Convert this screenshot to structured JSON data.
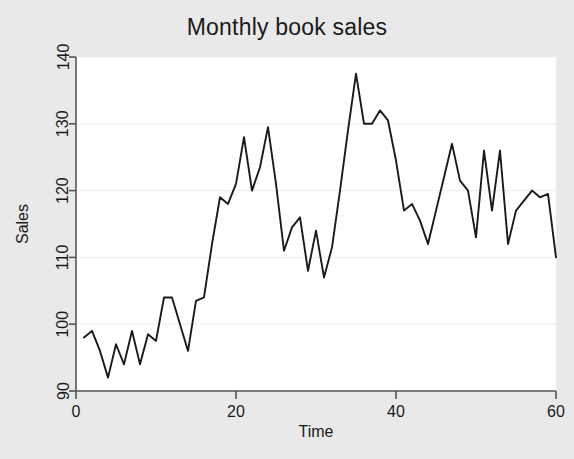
{
  "chart": {
    "title": "Monthly book sales",
    "ylabel": "Sales",
    "xlabel": "Time"
  },
  "chart_data": {
    "type": "line",
    "title": "Monthly book sales",
    "xlabel": "Time",
    "ylabel": "Sales",
    "xlim": [
      0,
      60
    ],
    "ylim": [
      90,
      140
    ],
    "xticks": [
      0,
      20,
      40,
      60
    ],
    "yticks": [
      90,
      100,
      110,
      120,
      130,
      140
    ],
    "grid": "horizontal",
    "legend": "none",
    "line_color": "#1a1a1a",
    "background_color": "#e9e9e9",
    "plot_background_color": "#ffffff",
    "series": [
      {
        "name": "Sales",
        "x": [
          1,
          2,
          3,
          4,
          5,
          6,
          7,
          8,
          9,
          10,
          11,
          12,
          13,
          14,
          15,
          16,
          17,
          18,
          19,
          20,
          21,
          22,
          23,
          24,
          25,
          26,
          27,
          28,
          29,
          30,
          31,
          32,
          33,
          34,
          35,
          36,
          37,
          38,
          39,
          40,
          41,
          42,
          43,
          44,
          45,
          46,
          47,
          48,
          49,
          50,
          51,
          52,
          53,
          54,
          55,
          56,
          57,
          58,
          59,
          60
        ],
        "values": [
          98.0,
          99.0,
          96.0,
          92.0,
          97.0,
          94.0,
          99.0,
          94.0,
          98.5,
          97.5,
          104.0,
          104.0,
          100.0,
          96.0,
          103.5,
          104.0,
          112.0,
          119.0,
          118.0,
          121.0,
          128.0,
          120.0,
          123.5,
          129.5,
          121.0,
          111.0,
          114.5,
          116.0,
          108.0,
          114.0,
          107.0,
          111.5,
          120.0,
          129.0,
          137.5,
          130.0,
          130.0,
          132.0,
          130.5,
          124.5,
          117.0,
          118.0,
          115.5,
          112.0,
          117.0,
          122.0,
          127.0,
          121.5,
          120.0,
          113.0,
          126.0,
          117.0,
          126.0,
          112.0,
          117.0,
          118.5,
          120.0,
          119.0,
          119.5,
          110.0
        ]
      }
    ]
  }
}
